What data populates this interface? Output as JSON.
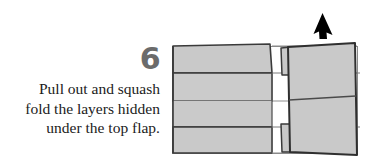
{
  "step": {
    "number": "6",
    "caption_lines": [
      "Pull out and squash",
      "fold the layers hidden",
      "under the top flap."
    ],
    "caption_text": "Pull out and squash fold the layers hidden under the top flap."
  },
  "figure": {
    "alt_label": "origami-fold-diagram",
    "arrow": {
      "name": "pull-up-arrow",
      "direction": "up"
    },
    "colors": {
      "paper_fill": "#c9c9c9",
      "paper_fill_light": "#d0d0d0",
      "outline": "#3a3a3a",
      "crease": "#6e6e6e",
      "background": "#ffffff",
      "step_number": "#6b6b6b",
      "caption_text": "#1b1b1b",
      "arrow_fill": "#000000"
    },
    "parts": [
      {
        "name": "left-panel-top-flap",
        "label": "top flap"
      },
      {
        "name": "left-panel-upper-layer",
        "label": "upper hidden layer"
      },
      {
        "name": "left-panel-middle-layer",
        "label": "middle hidden layer"
      },
      {
        "name": "left-panel-bottom-layer",
        "label": "bottom layer"
      },
      {
        "name": "center-open-region",
        "label": "open area"
      },
      {
        "name": "right-flap",
        "label": "right flap"
      },
      {
        "name": "right-flap-upper-tab",
        "label": "upper tab"
      },
      {
        "name": "right-flap-lower-tab",
        "label": "lower tab"
      }
    ]
  }
}
